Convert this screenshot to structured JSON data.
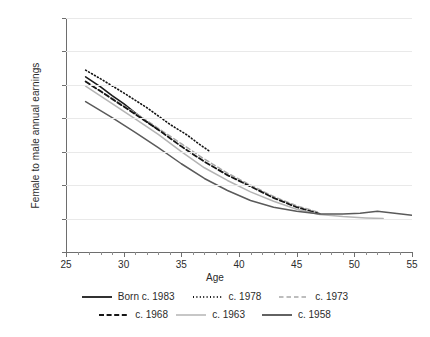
{
  "chart_data": {
    "type": "line",
    "title": "",
    "xlabel": "Age",
    "ylabel": "Female to male annual earnings",
    "xlim": [
      25,
      55
    ],
    "ylim": [
      0.65,
      1
    ],
    "xticks": [
      25,
      30,
      35,
      40,
      45,
      50,
      55
    ],
    "yticks": [
      0.65,
      0.7,
      0.75,
      0.8,
      0.85,
      0.9,
      0.95,
      1
    ],
    "xtick_labels": [
      "25",
      "30",
      "35",
      "40",
      "45",
      "50",
      "55"
    ],
    "ytick_labels": [
      "0.65",
      "0.7",
      "0.75",
      "0.8",
      "0.85",
      "0.9",
      "0.95",
      "1"
    ],
    "grid": "horizontal",
    "legend_position": "bottom",
    "series": [
      {
        "name": "Born c. 1983",
        "style": "solid",
        "color": "#1a1a1a",
        "width": 1.6,
        "x": [
          26.7,
          28,
          29,
          30,
          31,
          32,
          33
        ],
        "y": [
          0.912,
          0.897,
          0.884,
          0.872,
          0.858,
          0.845,
          0.833
        ]
      },
      {
        "name": "c. 1978",
        "style": "dotted",
        "color": "#111111",
        "width": 1.6,
        "x": [
          26.7,
          28,
          30,
          32,
          34,
          35.5,
          36.5,
          37.5
        ],
        "y": [
          0.922,
          0.909,
          0.888,
          0.866,
          0.841,
          0.825,
          0.812,
          0.8
        ]
      },
      {
        "name": "c. 1973",
        "style": "dashed-light",
        "color": "#a8a8a8",
        "width": 1.5,
        "x": [
          26.7,
          29,
          31,
          33,
          35,
          37,
          39,
          41,
          43,
          45,
          46.8
        ],
        "y": [
          0.905,
          0.88,
          0.858,
          0.835,
          0.812,
          0.789,
          0.768,
          0.75,
          0.733,
          0.719,
          0.71
        ]
      },
      {
        "name": "c. 1968",
        "style": "dashed",
        "color": "#161616",
        "width": 1.8,
        "x": [
          26.7,
          29,
          31,
          33,
          35,
          37,
          39,
          41,
          43,
          45,
          47
        ],
        "y": [
          0.905,
          0.879,
          0.856,
          0.833,
          0.808,
          0.785,
          0.765,
          0.748,
          0.731,
          0.717,
          0.707
        ]
      },
      {
        "name": "c. 1963",
        "style": "solid-light",
        "color": "#b4b4b4",
        "width": 1.5,
        "x": [
          26.7,
          29,
          31,
          33,
          35,
          37,
          39,
          41,
          43,
          45,
          47,
          49,
          51,
          52.5
        ],
        "y": [
          0.898,
          0.872,
          0.849,
          0.826,
          0.8,
          0.776,
          0.757,
          0.74,
          0.726,
          0.714,
          0.706,
          0.703,
          0.701,
          0.7
        ]
      },
      {
        "name": "c. 1958",
        "style": "solid-gray",
        "color": "#5a5a5a",
        "width": 1.5,
        "x": [
          26.7,
          29,
          31,
          33,
          35,
          37,
          39,
          41,
          43,
          45,
          47,
          49,
          50.5,
          52,
          53.5,
          55
        ],
        "y": [
          0.875,
          0.851,
          0.829,
          0.806,
          0.782,
          0.76,
          0.742,
          0.727,
          0.717,
          0.711,
          0.707,
          0.707,
          0.708,
          0.711,
          0.708,
          0.705
        ]
      }
    ]
  },
  "legend": {
    "rows": [
      [
        {
          "label": "Born c. 1983",
          "swatch": "solid-black"
        },
        {
          "label": "c. 1978",
          "swatch": "dotted-black"
        },
        {
          "label": "c. 1973",
          "swatch": "dashed-light"
        }
      ],
      [
        {
          "label": "c. 1968",
          "swatch": "dashed-black"
        },
        {
          "label": "c. 1963",
          "swatch": "solid-light"
        },
        {
          "label": "c. 1958",
          "swatch": "solid-gray"
        }
      ]
    ]
  }
}
